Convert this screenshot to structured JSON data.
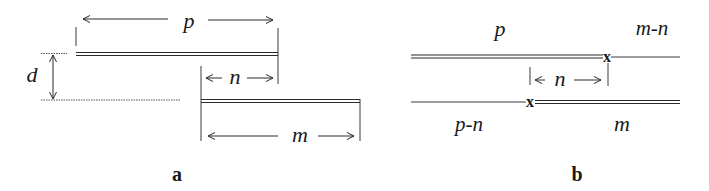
{
  "figure": {
    "panel_a": {
      "label": "a",
      "dims": {
        "p": "p",
        "n": "n",
        "m": "m",
        "d": "d"
      }
    },
    "panel_b": {
      "label": "b",
      "upper": {
        "left_label": "p",
        "right_label": "m-n",
        "crossover_mark": "x"
      },
      "lower": {
        "left_label": "p-n",
        "right_label": "m",
        "crossover_mark": "x"
      },
      "offset_label": "n"
    },
    "colors": {
      "ink": "#2a2a2a",
      "background": "#ffffff"
    }
  }
}
